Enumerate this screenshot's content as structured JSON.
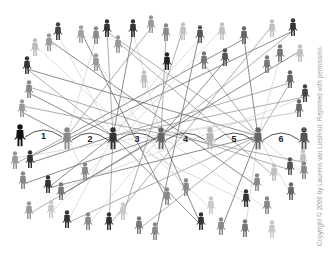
{
  "figure": {
    "credit": "Copyright © 2006 by Laurens van Lieshout. Reprinted with permission.",
    "chain_labels": [
      "1",
      "2",
      "3",
      "4",
      "5",
      "6"
    ],
    "colors": {
      "background": "#ffffff",
      "dark_person": "#222222",
      "mid_person": "#6e6e6e",
      "light_person": "#b8b8b8",
      "line_dark": "#555555",
      "line_light": "#bdbdbd",
      "credit_text": "#9a9a9a"
    },
    "chain_people": [
      {
        "x": 20,
        "y": 135,
        "shade": "#111111"
      },
      {
        "x": 67,
        "y": 138,
        "shade": "#8a8a8a"
      },
      {
        "x": 113,
        "y": 138,
        "shade": "#333333"
      },
      {
        "x": 161,
        "y": 138,
        "shade": "#666666"
      },
      {
        "x": 210,
        "y": 138,
        "shade": "#b5b5b5"
      },
      {
        "x": 258,
        "y": 138,
        "shade": "#666666"
      },
      {
        "x": 304,
        "y": 138,
        "shade": "#555555"
      }
    ],
    "people": [
      {
        "x": 35,
        "y": 47,
        "shade": "#bdbdbd"
      },
      {
        "x": 49,
        "y": 42,
        "shade": "#999999"
      },
      {
        "x": 58,
        "y": 31,
        "shade": "#444444"
      },
      {
        "x": 81,
        "y": 34,
        "shade": "#a0a0a0"
      },
      {
        "x": 96,
        "y": 35,
        "shade": "#888888"
      },
      {
        "x": 107,
        "y": 28,
        "shade": "#333333"
      },
      {
        "x": 118,
        "y": 44,
        "shade": "#999999"
      },
      {
        "x": 133,
        "y": 28,
        "shade": "#333333"
      },
      {
        "x": 151,
        "y": 24,
        "shade": "#999999"
      },
      {
        "x": 166,
        "y": 32,
        "shade": "#888888"
      },
      {
        "x": 183,
        "y": 31,
        "shade": "#c0c0c0"
      },
      {
        "x": 200,
        "y": 34,
        "shade": "#555555"
      },
      {
        "x": 222,
        "y": 31,
        "shade": "#c0c0c0"
      },
      {
        "x": 244,
        "y": 35,
        "shade": "#666666"
      },
      {
        "x": 272,
        "y": 28,
        "shade": "#c0c0c0"
      },
      {
        "x": 293,
        "y": 27,
        "shade": "#333333"
      },
      {
        "x": 167,
        "y": 61,
        "shade": "#222222"
      },
      {
        "x": 204,
        "y": 60,
        "shade": "#777777"
      },
      {
        "x": 225,
        "y": 57,
        "shade": "#555555"
      },
      {
        "x": 96,
        "y": 62,
        "shade": "#999999"
      },
      {
        "x": 144,
        "y": 79,
        "shade": "#c0c0c0"
      },
      {
        "x": 267,
        "y": 64,
        "shade": "#777777"
      },
      {
        "x": 280,
        "y": 53,
        "shade": "#777777"
      },
      {
        "x": 300,
        "y": 53,
        "shade": "#c0c0c0"
      },
      {
        "x": 290,
        "y": 79,
        "shade": "#666666"
      },
      {
        "x": 305,
        "y": 93,
        "shade": "#444444"
      },
      {
        "x": 299,
        "y": 108,
        "shade": "#666666"
      },
      {
        "x": 27,
        "y": 65,
        "shade": "#333333"
      },
      {
        "x": 29,
        "y": 89,
        "shade": "#888888"
      },
      {
        "x": 22,
        "y": 108,
        "shade": "#999999"
      },
      {
        "x": 15,
        "y": 160,
        "shade": "#999999"
      },
      {
        "x": 30,
        "y": 159,
        "shade": "#333333"
      },
      {
        "x": 23,
        "y": 180,
        "shade": "#888888"
      },
      {
        "x": 48,
        "y": 184,
        "shade": "#333333"
      },
      {
        "x": 61,
        "y": 191,
        "shade": "#777777"
      },
      {
        "x": 85,
        "y": 171,
        "shade": "#888888"
      },
      {
        "x": 29,
        "y": 210,
        "shade": "#999999"
      },
      {
        "x": 51,
        "y": 209,
        "shade": "#c8c8c8"
      },
      {
        "x": 67,
        "y": 219,
        "shade": "#333333"
      },
      {
        "x": 88,
        "y": 221,
        "shade": "#888888"
      },
      {
        "x": 109,
        "y": 221,
        "shade": "#333333"
      },
      {
        "x": 123,
        "y": 211,
        "shade": "#c8c8c8"
      },
      {
        "x": 139,
        "y": 225,
        "shade": "#777777"
      },
      {
        "x": 155,
        "y": 231,
        "shade": "#888888"
      },
      {
        "x": 167,
        "y": 196,
        "shade": "#888888"
      },
      {
        "x": 186,
        "y": 187,
        "shade": "#888888"
      },
      {
        "x": 211,
        "y": 205,
        "shade": "#c8c8c8"
      },
      {
        "x": 201,
        "y": 221,
        "shade": "#333333"
      },
      {
        "x": 221,
        "y": 226,
        "shade": "#888888"
      },
      {
        "x": 245,
        "y": 228,
        "shade": "#777777"
      },
      {
        "x": 272,
        "y": 229,
        "shade": "#c8c8c8"
      },
      {
        "x": 246,
        "y": 198,
        "shade": "#333333"
      },
      {
        "x": 267,
        "y": 205,
        "shade": "#888888"
      },
      {
        "x": 257,
        "y": 182,
        "shade": "#888888"
      },
      {
        "x": 274,
        "y": 172,
        "shade": "#c0c0c0"
      },
      {
        "x": 290,
        "y": 166,
        "shade": "#555555"
      },
      {
        "x": 291,
        "y": 191,
        "shade": "#666666"
      },
      {
        "x": 303,
        "y": 158,
        "shade": "#c0c0c0"
      },
      {
        "x": 304,
        "y": 170,
        "shade": "#888888"
      }
    ],
    "links": [
      [
        113,
        138,
        58,
        31
      ],
      [
        113,
        138,
        107,
        28
      ],
      [
        113,
        138,
        133,
        28
      ],
      [
        113,
        138,
        200,
        34
      ],
      [
        113,
        138,
        27,
        65
      ],
      [
        113,
        138,
        29,
        89
      ],
      [
        113,
        138,
        167,
        61
      ],
      [
        113,
        138,
        290,
        79
      ],
      [
        113,
        138,
        48,
        184
      ],
      [
        113,
        138,
        67,
        219
      ],
      [
        113,
        138,
        109,
        221
      ],
      [
        113,
        138,
        201,
        221
      ],
      [
        113,
        138,
        246,
        198
      ],
      [
        113,
        138,
        305,
        93
      ],
      [
        113,
        138,
        30,
        159
      ],
      [
        67,
        138,
        96,
        35
      ],
      [
        67,
        138,
        151,
        24
      ],
      [
        67,
        138,
        22,
        108
      ],
      [
        67,
        138,
        85,
        171
      ],
      [
        67,
        138,
        15,
        160
      ],
      [
        67,
        138,
        244,
        35
      ],
      [
        161,
        138,
        133,
        28
      ],
      [
        161,
        138,
        166,
        32
      ],
      [
        161,
        138,
        225,
        57
      ],
      [
        161,
        138,
        88,
        221
      ],
      [
        161,
        138,
        29,
        210
      ],
      [
        161,
        138,
        201,
        221
      ],
      [
        161,
        138,
        267,
        205
      ],
      [
        161,
        138,
        293,
        27
      ],
      [
        161,
        138,
        23,
        180
      ],
      [
        161,
        138,
        299,
        108
      ],
      [
        258,
        138,
        107,
        28
      ],
      [
        258,
        138,
        244,
        35
      ],
      [
        258,
        138,
        280,
        53
      ],
      [
        258,
        138,
        290,
        79
      ],
      [
        258,
        138,
        221,
        226
      ],
      [
        258,
        138,
        245,
        228
      ],
      [
        258,
        138,
        139,
        225
      ],
      [
        258,
        138,
        48,
        184
      ],
      [
        258,
        138,
        291,
        191
      ],
      [
        258,
        138,
        67,
        219
      ],
      [
        258,
        138,
        27,
        65
      ],
      [
        258,
        138,
        304,
        170
      ],
      [
        258,
        138,
        204,
        60
      ],
      [
        30,
        159,
        293,
        27
      ],
      [
        61,
        191,
        305,
        93
      ],
      [
        29,
        89,
        290,
        166
      ],
      [
        49,
        42,
        257,
        182
      ],
      [
        96,
        62,
        186,
        187
      ],
      [
        118,
        44,
        274,
        172
      ],
      [
        81,
        34,
        167,
        196
      ],
      [
        222,
        31,
        51,
        209
      ],
      [
        183,
        31,
        123,
        211
      ],
      [
        200,
        34,
        155,
        231
      ],
      [
        35,
        47,
        211,
        205
      ],
      [
        272,
        28,
        109,
        221
      ],
      [
        300,
        53,
        61,
        191
      ],
      [
        15,
        160,
        299,
        108
      ],
      [
        22,
        108,
        303,
        158
      ]
    ]
  }
}
